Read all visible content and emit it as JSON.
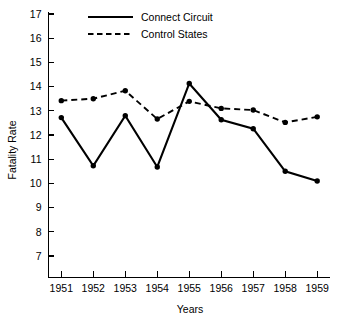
{
  "chart_data": {
    "type": "line",
    "title": "",
    "xlabel": "Years",
    "ylabel": "Fatality Rate",
    "categories": [
      "1951",
      "1952",
      "1953",
      "1954",
      "1955",
      "1956",
      "1957",
      "1958",
      "1959"
    ],
    "x": [
      1951,
      1952,
      1953,
      1954,
      1955,
      1956,
      1957,
      1958,
      1959
    ],
    "xlim": [
      1950.6,
      1959.4
    ],
    "ylim": [
      7,
      17
    ],
    "yticks": [
      7,
      8,
      9,
      10,
      11,
      12,
      13,
      14,
      15,
      16,
      17
    ],
    "ytick_labels": [
      "7",
      "8",
      "9",
      "10",
      "11",
      "12",
      "13",
      "14",
      "15",
      "16",
      "17"
    ],
    "grid": false,
    "legend_position": "top-center",
    "series": [
      {
        "name": "Connect Circuit",
        "style": "solid",
        "color": "#000000",
        "marker": "circle",
        "values": [
          12.72,
          10.73,
          12.8,
          10.68,
          14.13,
          12.63,
          12.26,
          10.5,
          10.1
        ]
      },
      {
        "name": "Control States",
        "style": "dashed",
        "color": "#000000",
        "marker": "circle",
        "values": [
          13.42,
          13.5,
          13.83,
          12.66,
          13.39,
          13.1,
          13.03,
          12.52,
          12.75
        ]
      }
    ]
  },
  "axis": {
    "y_title": "Fatality Rate",
    "x_title": "Years"
  },
  "legend": {
    "entries": [
      {
        "label": "Connect Circuit",
        "style": "solid"
      },
      {
        "label": "Control States",
        "style": "dashed"
      }
    ]
  }
}
